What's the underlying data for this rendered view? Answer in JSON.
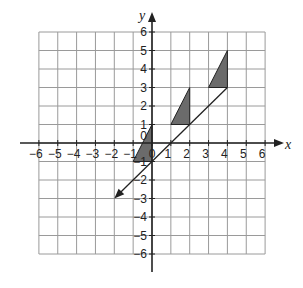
{
  "diagram": {
    "type": "coordinate-grid",
    "x_range": [
      -6,
      6
    ],
    "y_range": [
      -6,
      6
    ],
    "x_axis_label": "x",
    "y_axis_label": "y",
    "x_ticks": [
      "-6",
      "-5",
      "-4",
      "-3",
      "-2",
      "-1",
      "0",
      "1",
      "2",
      "3",
      "4",
      "5",
      "6"
    ],
    "y_ticks": [
      "6",
      "5",
      "4",
      "3",
      "2",
      "1",
      "0",
      "-1",
      "-2",
      "-3",
      "-4",
      "-5",
      "-6"
    ],
    "line": {
      "from": [
        4,
        3
      ],
      "to": [
        -2,
        -3
      ],
      "arrow_at_end": true,
      "equation": "y = x - 1"
    },
    "triangles": [
      {
        "vertices": [
          [
            -1,
            -1
          ],
          [
            0,
            1
          ],
          [
            0,
            -1
          ]
        ],
        "fill": "#6b6b6b"
      },
      {
        "vertices": [
          [
            1,
            1
          ],
          [
            2,
            3
          ],
          [
            2,
            1
          ]
        ],
        "fill": "#6b6b6b"
      },
      {
        "vertices": [
          [
            3,
            3
          ],
          [
            4,
            5
          ],
          [
            4,
            3
          ]
        ],
        "fill": "#6b6b6b"
      }
    ],
    "colors": {
      "grid": "#9a9a9a",
      "axis": "#222222",
      "triangle_fill": "#6b6b6b",
      "line": "#222222"
    }
  }
}
